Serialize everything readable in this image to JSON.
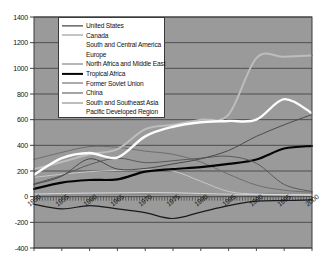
{
  "chart_data": {
    "type": "line",
    "title": "",
    "xlabel": "",
    "ylabel": "",
    "xlim": [
      1950,
      2000
    ],
    "ylim": [
      -400,
      1400
    ],
    "ytick_step": 200,
    "xtick_step": 5,
    "grid": true,
    "legend_position": "top-left-inside",
    "plot_background": "#9a9a9a",
    "yticks": [
      "1400",
      "1200",
      "1000",
      "800",
      "600",
      "400",
      "200",
      "0",
      "-200",
      "-400"
    ],
    "xticks": [
      "1950",
      "1955",
      "1960",
      "1965",
      "1970",
      "1975",
      "1980",
      "1985",
      "1990",
      "1995",
      "2000"
    ],
    "x": [
      1950,
      1955,
      1960,
      1965,
      1970,
      1975,
      1980,
      1985,
      1990,
      1995,
      2000
    ],
    "series": [
      {
        "name": "United States",
        "color": "#1a1a1a",
        "width": 1.2,
        "values": [
          -60,
          -95,
          -70,
          -95,
          -125,
          -170,
          -120,
          -70,
          -35,
          -30,
          -25
        ]
      },
      {
        "name": "Canada",
        "color": "#8a8a8a",
        "width": 1.0,
        "values": [
          10,
          12,
          14,
          16,
          18,
          20,
          22,
          24,
          26,
          28,
          30
        ]
      },
      {
        "name": "South and Central America",
        "color": "#c8c8c8",
        "width": 1.0,
        "values": [
          150,
          175,
          195,
          205,
          210,
          200,
          120,
          40,
          20,
          15,
          10
        ]
      },
      {
        "name": "Europe",
        "color": "#d8d8d8",
        "width": 1.0,
        "values": [
          20,
          25,
          28,
          30,
          32,
          30,
          25,
          20,
          18,
          16,
          15
        ]
      },
      {
        "name": "North Africa and Middle East",
        "color": "#6e6e6e",
        "width": 1.0,
        "values": [
          290,
          345,
          390,
          385,
          355,
          330,
          270,
          175,
          90,
          50,
          35
        ]
      },
      {
        "name": "Tropical Africa",
        "color": "#050505",
        "width": 2.2,
        "values": [
          60,
          110,
          130,
          135,
          195,
          215,
          230,
          255,
          290,
          375,
          395
        ]
      },
      {
        "name": "Former Soviet Union",
        "color": "#5a5a5a",
        "width": 1.0,
        "values": [
          100,
          165,
          250,
          300,
          265,
          280,
          300,
          315,
          260,
          95,
          40
        ]
      },
      {
        "name": "China",
        "color": "#4a4a4a",
        "width": 1.0,
        "values": [
          95,
          160,
          295,
          215,
          220,
          255,
          295,
          360,
          470,
          560,
          640
        ]
      },
      {
        "name": "South and Southeast Asia",
        "color": "#bdbdbd",
        "width": 2.0,
        "values": [
          215,
          270,
          330,
          370,
          525,
          560,
          600,
          640,
          1080,
          1090,
          1100
        ]
      },
      {
        "name": "Pacific Developed Region",
        "color": "#fdfdfd",
        "width": 2.4,
        "values": [
          170,
          300,
          340,
          305,
          470,
          545,
          580,
          590,
          600,
          760,
          650
        ]
      }
    ]
  },
  "legend": {
    "items": [
      {
        "label": "United  States"
      },
      {
        "label": "Canada"
      },
      {
        "label": "South and Central America"
      },
      {
        "label": "Europe"
      },
      {
        "label": "North Africa and Middle East"
      },
      {
        "label": "Tropical Africa"
      },
      {
        "label": "Former Soviet Union"
      },
      {
        "label": "China"
      },
      {
        "label": "South and Southeast Asia"
      },
      {
        "label": "Pacific Developed Region"
      }
    ]
  }
}
